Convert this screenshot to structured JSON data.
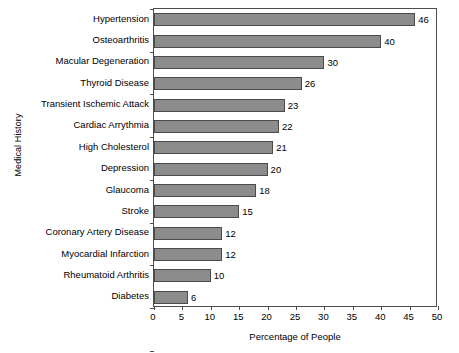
{
  "chart_data": {
    "type": "bar",
    "orientation": "horizontal",
    "title": "",
    "xlabel": "Percentage of People",
    "ylabel": "Medical History",
    "xlim": [
      0,
      50
    ],
    "xticks": [
      0,
      5,
      10,
      15,
      20,
      25,
      30,
      35,
      40,
      45,
      50
    ],
    "grid": false,
    "legend": false,
    "bar_color": "#8c8c8c",
    "bar_edge_color": "#4a4a4a",
    "categories": [
      "Hypertension",
      "Osteoarthritis",
      "Macular Degeneration",
      "Thyroid Disease",
      "Transient Ischemic Attack",
      "Cardiac Arrythmia",
      "High Cholesterol",
      "Depression",
      "Glaucoma",
      "Stroke",
      "Coronary Artery Disease",
      "Myocardial Infarction",
      "Rheumatoid Arthritis",
      "Diabetes"
    ],
    "values": [
      46,
      40,
      30,
      26,
      23,
      22,
      21,
      20,
      18,
      15,
      12,
      12,
      10,
      6
    ],
    "value_labels": [
      "46",
      "40",
      "30",
      "26",
      "23",
      "22",
      "21",
      "20",
      "18",
      "15",
      "12",
      "12",
      "10",
      "6"
    ],
    "xtick_labels": [
      "0",
      "5",
      "10",
      "15",
      "20",
      "25",
      "30",
      "35",
      "40",
      "45",
      "50"
    ]
  }
}
